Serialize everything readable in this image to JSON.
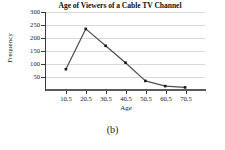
{
  "chart_data": {
    "type": "line",
    "title": "Age of Viewers of a Cable TV Channel",
    "xlabel": "Age",
    "ylabel": "Frequency",
    "x": [
      10.5,
      20.5,
      30.5,
      40.5,
      50.5,
      60.5,
      70.5
    ],
    "categories": [
      "10.5",
      "20.5",
      "30.5",
      "40.5",
      "50.5",
      "60.5",
      "70.5"
    ],
    "values": [
      80,
      235,
      170,
      105,
      35,
      15,
      10
    ],
    "series": [
      {
        "name": "Frequency",
        "values": [
          80,
          235,
          170,
          105,
          35,
          15,
          10
        ]
      }
    ],
    "ylim": [
      0,
      300
    ],
    "xlim": [
      0.5,
      80.5
    ],
    "yticks": [
      50,
      100,
      150,
      200,
      250,
      300
    ],
    "ytick_labels": [
      "50",
      "100",
      "150",
      "200",
      "250",
      "300"
    ],
    "xticks": [
      10.5,
      20.5,
      30.5,
      40.5,
      50.5,
      60.5,
      70.5
    ],
    "xtick_labels": [
      "10.5",
      "20.5",
      "30.5",
      "40.5",
      "50.5",
      "60.5",
      "70.5"
    ],
    "grid": "horizontal",
    "legend": "none",
    "marker": "square",
    "line_color": "#4d4d4d",
    "marker_color": "#1a1a1a",
    "grid_color": "#d8d8d8",
    "axis_color": "#3a3a3a",
    "background": "#ffffff"
  },
  "caption": {
    "label": "(b)"
  }
}
